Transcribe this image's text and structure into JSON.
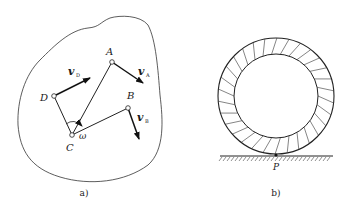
{
  "figure_a": {
    "caption": "a)",
    "points": {
      "A": "A",
      "B": "B",
      "C": "C",
      "D": "D"
    },
    "angular_velocity": "ω",
    "velocities": {
      "vA": {
        "symbol": "v",
        "subscript": "A"
      },
      "vB": {
        "symbol": "v",
        "subscript": "B"
      },
      "vD": {
        "symbol": "v",
        "subscript": "D"
      }
    }
  },
  "figure_b": {
    "caption": "b)",
    "contact_point": "P"
  }
}
